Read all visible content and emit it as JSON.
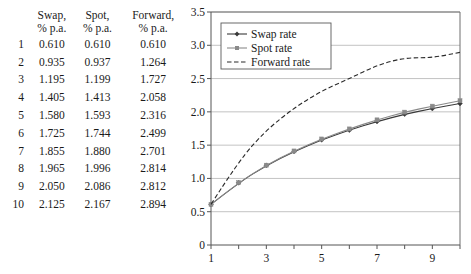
{
  "table": {
    "index_header": "",
    "columns": [
      {
        "line1": "Swap,",
        "line2": "% p.a."
      },
      {
        "line1": "Spot,",
        "line2": "% p.a."
      },
      {
        "line1": "Forward,",
        "line2": "% p.a."
      }
    ],
    "rows": [
      {
        "index": "1",
        "swap": "0.610",
        "spot": "0.610",
        "forward": "0.610"
      },
      {
        "index": "2",
        "swap": "0.935",
        "spot": "0.937",
        "forward": "1.264"
      },
      {
        "index": "3",
        "swap": "1.195",
        "spot": "1.199",
        "forward": "1.727"
      },
      {
        "index": "4",
        "swap": "1.405",
        "spot": "1.413",
        "forward": "2.058"
      },
      {
        "index": "5",
        "swap": "1.580",
        "spot": "1.593",
        "forward": "2.316"
      },
      {
        "index": "6",
        "swap": "1.725",
        "spot": "1.744",
        "forward": "2.499"
      },
      {
        "index": "7",
        "swap": "1.855",
        "spot": "1.880",
        "forward": "2.701"
      },
      {
        "index": "8",
        "swap": "1.965",
        "spot": "1.996",
        "forward": "2.814"
      },
      {
        "index": "9",
        "swap": "2.050",
        "spot": "2.086",
        "forward": "2.812"
      },
      {
        "index": "10",
        "swap": "2.125",
        "spot": "2.167",
        "forward": "2.894"
      }
    ]
  },
  "chart_data": {
    "type": "line",
    "title": "",
    "xlabel": "",
    "ylabel": "",
    "x": [
      1,
      2,
      3,
      4,
      5,
      6,
      7,
      8,
      9,
      10
    ],
    "xlim": [
      1,
      10
    ],
    "ylim": [
      0,
      3.5
    ],
    "xticks": [
      1,
      3,
      5,
      7,
      9
    ],
    "xtick_labels": [
      "1",
      "3",
      "5",
      "7",
      "9"
    ],
    "yticks": [
      0,
      0.5,
      1.0,
      1.5,
      2.0,
      2.5,
      3.0,
      3.5
    ],
    "ytick_labels": [
      "0",
      "0.5",
      "1.0",
      "1.5",
      "2.0",
      "2.5",
      "3.0",
      "3.5"
    ],
    "grid": "horizontal",
    "legend_position": "top-left",
    "series": [
      {
        "name": "Swap rate",
        "marker": "diamond",
        "line": "solid",
        "color": "#3a3a3a",
        "values": [
          0.61,
          0.935,
          1.195,
          1.405,
          1.58,
          1.725,
          1.855,
          1.965,
          2.05,
          2.125
        ]
      },
      {
        "name": "Spot rate",
        "marker": "square",
        "line": "solid",
        "color": "#8a8a8a",
        "values": [
          0.61,
          0.937,
          1.199,
          1.413,
          1.593,
          1.744,
          1.88,
          1.996,
          2.086,
          2.167
        ]
      },
      {
        "name": "Forward rate",
        "marker": "none",
        "line": "dashed",
        "color": "#2b2b2b",
        "values": [
          0.61,
          1.264,
          1.727,
          2.058,
          2.316,
          2.499,
          2.701,
          2.814,
          2.812,
          2.894
        ]
      }
    ]
  }
}
